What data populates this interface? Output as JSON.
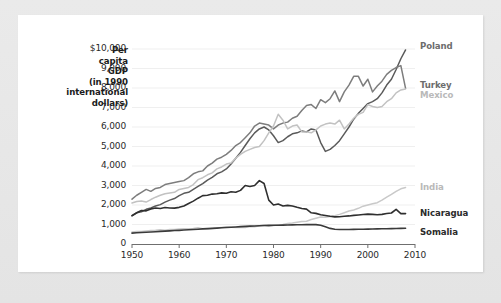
{
  "figure": {
    "axis_title_lines": [
      "Per",
      "capita",
      "GDP",
      "(in 1990",
      "international",
      "dollars)"
    ],
    "axis_title_text": "Per capita GDP (in 1990 international dollars)"
  },
  "chart_data": {
    "type": "line",
    "title": "",
    "subtitle": "",
    "xlabel": "",
    "ylabel": "Per capita GDP (in 1990 international dollars)",
    "xlim": [
      1950,
      2010
    ],
    "ylim": [
      0,
      10000
    ],
    "grid": true,
    "grid_axis": "y",
    "legend_position": "right-end-of-line",
    "xticks": [
      1950,
      1960,
      1970,
      1980,
      1990,
      2000,
      2010
    ],
    "xticklabels": [
      "1950",
      "1960",
      "1970",
      "1980",
      "1990",
      "2000",
      "2010"
    ],
    "yticks": [
      0,
      1000,
      2000,
      3000,
      4000,
      5000,
      6000,
      7000,
      8000,
      9000,
      10000
    ],
    "yticklabels": [
      "0",
      "1,000",
      "2,000",
      "3,000",
      "4,000",
      "5,000",
      "6,000",
      "7,000",
      "8,000",
      "9,000",
      "$10,000"
    ],
    "x": [
      1950,
      1951,
      1952,
      1953,
      1954,
      1955,
      1956,
      1957,
      1958,
      1959,
      1960,
      1961,
      1962,
      1963,
      1964,
      1965,
      1966,
      1967,
      1968,
      1969,
      1970,
      1971,
      1972,
      1973,
      1974,
      1975,
      1976,
      1977,
      1978,
      1979,
      1980,
      1981,
      1982,
      1983,
      1984,
      1985,
      1986,
      1987,
      1988,
      1989,
      1990,
      1991,
      1992,
      1993,
      1994,
      1995,
      1996,
      1997,
      1998,
      1999,
      2000,
      2001,
      2002,
      2003,
      2004,
      2005,
      2006,
      2007,
      2008
    ],
    "series": [
      {
        "name": "Poland",
        "label": "Poland",
        "color": "#5a5a5a",
        "label_style": "mid",
        "end_value": 9950,
        "values": [
          1450,
          1600,
          1650,
          1780,
          1850,
          1950,
          2020,
          2150,
          2250,
          2330,
          2480,
          2600,
          2650,
          2800,
          2950,
          3100,
          3280,
          3420,
          3600,
          3700,
          3850,
          4100,
          4400,
          4700,
          5050,
          5400,
          5700,
          5900,
          6000,
          5850,
          5550,
          5200,
          5300,
          5500,
          5650,
          5700,
          5800,
          5750,
          5900,
          5850,
          5200,
          4750,
          4850,
          5050,
          5300,
          5650,
          6000,
          6400,
          6700,
          6950,
          7200,
          7300,
          7450,
          7750,
          8150,
          8450,
          8950,
          9500,
          9950
        ]
      },
      {
        "name": "Turkey",
        "label": "Turkey",
        "color": "#7d7d7d",
        "label_style": "mid",
        "end_value": 7980,
        "values": [
          2300,
          2500,
          2650,
          2800,
          2700,
          2850,
          2900,
          3050,
          3100,
          3150,
          3200,
          3250,
          3400,
          3600,
          3700,
          3750,
          4000,
          4150,
          4350,
          4450,
          4600,
          4800,
          5050,
          5200,
          5450,
          5700,
          6050,
          6200,
          6150,
          6100,
          5900,
          6100,
          6200,
          6250,
          6450,
          6550,
          6850,
          7100,
          7150,
          6950,
          7400,
          7250,
          7450,
          7850,
          7300,
          7800,
          8150,
          8600,
          8600,
          8100,
          8450,
          7800,
          8100,
          8350,
          8700,
          8900,
          9050,
          9150,
          7980
        ]
      },
      {
        "name": "Mexico",
        "label": "Mexico",
        "color": "#c2c2c2",
        "label_style": "light",
        "end_value": 7950,
        "values": [
          2100,
          2180,
          2200,
          2150,
          2280,
          2400,
          2500,
          2580,
          2620,
          2650,
          2800,
          2850,
          2900,
          3050,
          3300,
          3400,
          3550,
          3650,
          3850,
          3950,
          4100,
          4150,
          4400,
          4600,
          4750,
          4850,
          4950,
          5000,
          5300,
          5700,
          6050,
          6650,
          6350,
          5900,
          6050,
          6100,
          5750,
          5750,
          5700,
          5850,
          6050,
          6150,
          6200,
          6150,
          6350,
          5900,
          6150,
          6450,
          6650,
          6750,
          7150,
          7050,
          7000,
          7050,
          7300,
          7450,
          7750,
          7900,
          7950
        ]
      },
      {
        "name": "India",
        "label": "India",
        "color": "#c9c9c9",
        "label_style": "light",
        "end_value": 2900,
        "values": [
          620,
          635,
          645,
          670,
          690,
          700,
          725,
          700,
          740,
          745,
          775,
          780,
          780,
          800,
          830,
          780,
          765,
          800,
          815,
          850,
          875,
          860,
          845,
          865,
          850,
          900,
          890,
          940,
          965,
          905,
          950,
          985,
          995,
          1055,
          1080,
          1115,
          1150,
          1165,
          1255,
          1320,
          1380,
          1370,
          1415,
          1455,
          1520,
          1605,
          1695,
          1745,
          1830,
          1940,
          2000,
          2060,
          2120,
          2250,
          2400,
          2540,
          2700,
          2830,
          2900
        ]
      },
      {
        "name": "Nicaragua",
        "label": "Nicaragua",
        "color": "#2f2f2f",
        "label_style": "dark",
        "end_value": 1560,
        "values": [
          1450,
          1600,
          1720,
          1700,
          1800,
          1850,
          1820,
          1870,
          1850,
          1840,
          1880,
          1950,
          2080,
          2200,
          2350,
          2480,
          2500,
          2560,
          2580,
          2620,
          2600,
          2680,
          2650,
          2750,
          3000,
          2950,
          3000,
          3250,
          3100,
          2250,
          2000,
          2050,
          1950,
          1980,
          1950,
          1880,
          1820,
          1790,
          1600,
          1570,
          1500,
          1460,
          1420,
          1390,
          1400,
          1420,
          1440,
          1470,
          1490,
          1510,
          1530,
          1520,
          1500,
          1520,
          1560,
          1590,
          1780,
          1560,
          1560
        ]
      },
      {
        "name": "Somalia",
        "label": "Somalia",
        "color": "#3a3a3a",
        "label_style": "dark",
        "end_value": 810,
        "values": [
          560,
          575,
          590,
          600,
          615,
          630,
          645,
          660,
          675,
          690,
          700,
          715,
          730,
          745,
          760,
          775,
          790,
          800,
          815,
          830,
          845,
          860,
          875,
          890,
          905,
          915,
          925,
          935,
          945,
          955,
          960,
          965,
          970,
          975,
          980,
          985,
          990,
          995,
          1000,
          995,
          960,
          880,
          800,
          760,
          745,
          740,
          745,
          750,
          755,
          760,
          765,
          770,
          775,
          780,
          785,
          790,
          795,
          800,
          810
        ]
      }
    ]
  }
}
